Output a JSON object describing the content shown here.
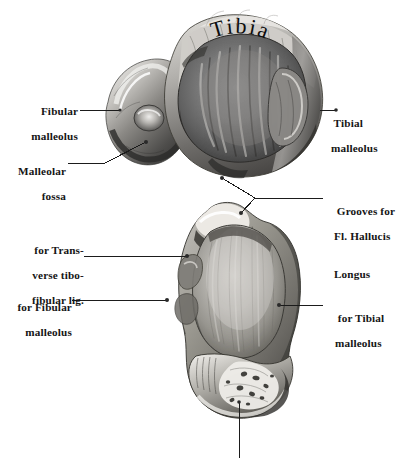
{
  "plate": {
    "title": "Tibia and Fibula distal articular surfaces",
    "background_color": "#ffffff",
    "ink_color": "#151515",
    "width": 410,
    "height": 458
  },
  "figures": [
    {
      "id": "upper-figure",
      "name": "distal-end-of-tibia-and-fibula-inferior-view",
      "inscription": "Tibia"
    },
    {
      "id": "lower-figure",
      "name": "talus-superior-view",
      "inscription": ""
    }
  ],
  "labels": [
    {
      "id": "fibular-malleolus",
      "lines": [
        "Fibular",
        "malleolus"
      ],
      "side": "left",
      "figure": "upper-figure"
    },
    {
      "id": "malleolar-fossa",
      "lines": [
        "Malleolar",
        "fossa"
      ],
      "side": "left",
      "figure": "upper-figure"
    },
    {
      "id": "tibial-malleolus",
      "lines": [
        "Tibial",
        "malleolus"
      ],
      "side": "right",
      "figure": "upper-figure"
    },
    {
      "id": "grooves-fl-hallucis-longus",
      "lines": [
        "Grooves for",
        "Fl. Hallucis",
        "Longus"
      ],
      "side": "right",
      "figure": "upper-figure"
    },
    {
      "id": "for-transverse-tibofibular-lig",
      "lines": [
        "for Trans-",
        "verse tibo-",
        "fibular lig."
      ],
      "side": "left",
      "figure": "lower-figure"
    },
    {
      "id": "for-fibular-malleolus",
      "lines": [
        "for Fibular",
        "malleolus"
      ],
      "side": "left",
      "figure": "lower-figure"
    },
    {
      "id": "for-tibial-malleolus",
      "lines": [
        "for Tibial",
        "malleolus"
      ],
      "side": "right",
      "figure": "lower-figure"
    }
  ],
  "inscriptions": {
    "tibia": "Tibia"
  }
}
